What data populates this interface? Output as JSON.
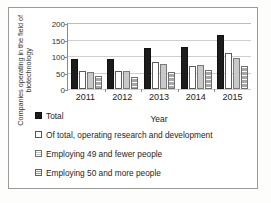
{
  "chart_data": {
    "type": "bar",
    "title": "",
    "xlabel": "Year",
    "ylabel": "Companies operating in the field of biotechnology",
    "categories": [
      "2011",
      "2012",
      "2013",
      "2014",
      "2015"
    ],
    "ylim": [
      0,
      200
    ],
    "yticks": [
      0,
      50,
      100,
      150,
      200
    ],
    "grid": true,
    "legend_position": "bottom-left",
    "series": [
      {
        "name": "Total",
        "color": "#1c1c1c",
        "pattern": "solid",
        "values": [
          92,
          91,
          123,
          128,
          163
        ]
      },
      {
        "name": "Of total, operating research and development",
        "color": "#ffffff",
        "pattern": "outline",
        "values": [
          55,
          55,
          82,
          71,
          108
        ]
      },
      {
        "name": "Employing 49 and fewer people",
        "color": "#c9c9c9",
        "pattern": "light-gray",
        "values": [
          53,
          56,
          76,
          72,
          94
        ]
      },
      {
        "name": "Employing 50 and more people",
        "color": "#b4b4b4",
        "pattern": "horizontal-stripes",
        "values": [
          40,
          37,
          53,
          59,
          70
        ]
      }
    ]
  },
  "axes": {
    "y_title": "Companies operating in the field of biotechnology",
    "x_title": "Year",
    "y_ticks": [
      "200",
      "150",
      "100",
      "50",
      "0"
    ],
    "x_ticks": [
      "2011",
      "2012",
      "2013",
      "2014",
      "2015"
    ]
  },
  "legend": {
    "items": [
      {
        "label": "Total"
      },
      {
        "label": "Of total, operating research and development"
      },
      {
        "label": "Employing 49 and fewer people"
      },
      {
        "label": "Employing 50 and more people"
      }
    ]
  }
}
